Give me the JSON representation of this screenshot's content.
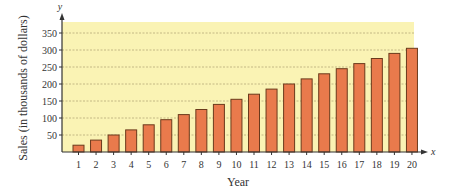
{
  "chart_data": {
    "type": "bar",
    "title": "",
    "xlabel": "Year",
    "ylabel": "Sales (in thousands of dollars)",
    "x_axis_letter": "x",
    "y_axis_letter": "y",
    "categories": [
      "1",
      "2",
      "3",
      "4",
      "5",
      "6",
      "7",
      "8",
      "9",
      "10",
      "11",
      "12",
      "13",
      "14",
      "15",
      "16",
      "17",
      "18",
      "19",
      "20"
    ],
    "values": [
      20,
      35,
      50,
      65,
      80,
      95,
      110,
      125,
      140,
      155,
      170,
      185,
      200,
      215,
      230,
      245,
      260,
      275,
      290,
      305
    ],
    "ylim": [
      0,
      380
    ],
    "yticks": [
      50,
      100,
      150,
      200,
      250,
      300,
      350
    ],
    "grid": true,
    "legend": null
  },
  "colors": {
    "plot_background": "#faf3b4",
    "bar_fill": "#e97a4c",
    "bar_stroke": "#6b3a1c",
    "gridline": "#b5a87a",
    "axis": "#333333"
  }
}
